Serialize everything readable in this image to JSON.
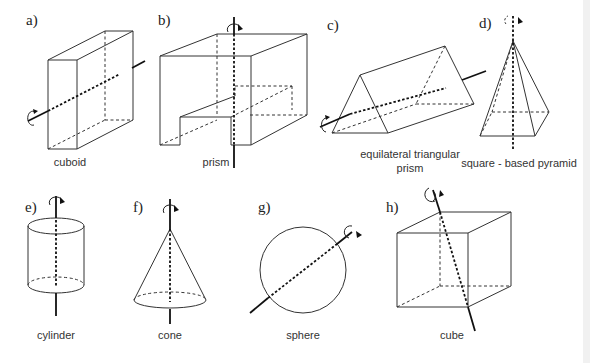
{
  "figure": {
    "panels": [
      {
        "id": "a",
        "letter": "a)",
        "caption": "cuboid"
      },
      {
        "id": "b",
        "letter": "b)",
        "caption": "prism"
      },
      {
        "id": "c",
        "letter": "c)",
        "caption_line1": "equilateral triangular",
        "caption_line2": "prism"
      },
      {
        "id": "d",
        "letter": "d)",
        "caption": "square - based pyramid"
      },
      {
        "id": "e",
        "letter": "e)",
        "caption": "cylinder"
      },
      {
        "id": "f",
        "letter": "f)",
        "caption": "cone"
      },
      {
        "id": "g",
        "letter": "g)",
        "caption": "sphere"
      },
      {
        "id": "h",
        "letter": "h)",
        "caption": "cube"
      }
    ],
    "colors": {
      "line": "#333333",
      "axis": "#111111",
      "background": "#ffffff"
    }
  }
}
